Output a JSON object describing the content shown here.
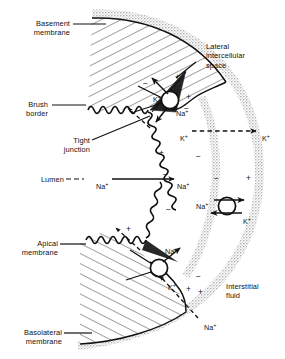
{
  "figure": {
    "background_color": "#ffffff",
    "ink_color": "#111111",
    "shade_color": "#c9c9c9"
  },
  "labels": {
    "basement_membrane": "Basement\nmembrane",
    "brush_border": "Brush\nborder",
    "tight_junction": "Tight\njunction",
    "lumen": "Lumen",
    "apical_membrane": "Apical\nmembrane",
    "basolateral_membrane": "Basolateral\nmembrane",
    "lateral_intercellular_space": "Lateral\nintercellular\nspace",
    "interstitial_fluid": "Interstitial\nfluid"
  },
  "ions": {
    "sodium": "Na",
    "potassium": "K",
    "charge_superscript": "+"
  },
  "ion_labels": [
    {
      "id": "na-upper-pump",
      "text": "Na+",
      "x": 176,
      "y": 109
    },
    {
      "id": "k-upper-pump",
      "text": "K+",
      "x": 153,
      "y": 95
    },
    {
      "id": "k-left-dashed",
      "text": "K+",
      "x": 180,
      "y": 134
    },
    {
      "id": "k-right-dashed",
      "text": "K+",
      "x": 262,
      "y": 134
    },
    {
      "id": "na-lumen-left",
      "text": "Na+",
      "x": 96,
      "y": 182
    },
    {
      "id": "na-lumen-right",
      "text": "Na+",
      "x": 177,
      "y": 182
    },
    {
      "id": "na-right-pump",
      "text": "Na+",
      "x": 196,
      "y": 202
    },
    {
      "id": "k-right-pump",
      "text": "K+",
      "x": 243,
      "y": 217
    },
    {
      "id": "na-lower-pump",
      "text": "Na+",
      "x": 165,
      "y": 247
    },
    {
      "id": "k-lower-pump",
      "text": "K+",
      "x": 168,
      "y": 283
    },
    {
      "id": "na-interstitial",
      "text": "Na+",
      "x": 204,
      "y": 323
    }
  ],
  "charges": [
    {
      "sign": "-",
      "x": 143,
      "y": 79
    },
    {
      "sign": "+",
      "x": 175,
      "y": 73
    },
    {
      "sign": "+",
      "x": 186,
      "y": 93
    },
    {
      "sign": "-",
      "x": 184,
      "y": 104
    },
    {
      "sign": "+",
      "x": 159,
      "y": 149
    },
    {
      "sign": "-",
      "x": 196,
      "y": 152
    },
    {
      "sign": "-",
      "x": 163,
      "y": 170
    },
    {
      "sign": "-",
      "x": 214,
      "y": 174
    },
    {
      "sign": "+",
      "x": 246,
      "y": 174
    },
    {
      "sign": "+",
      "x": 126,
      "y": 225
    },
    {
      "sign": "-",
      "x": 166,
      "y": 205
    },
    {
      "sign": "-",
      "x": 196,
      "y": 272
    },
    {
      "sign": "+",
      "x": 186,
      "y": 285
    },
    {
      "sign": "+",
      "x": 198,
      "y": 288
    }
  ],
  "structures": {
    "cell_interior_fill": "hatched-diagonal",
    "membrane_band": "gray-shaded-band",
    "brush_border_style": "zigzag-microvilli",
    "pumps": [
      {
        "id": "pump-upper-lateral",
        "cx": 170,
        "cy": 100,
        "r": 9
      },
      {
        "id": "pump-right-lateral",
        "cx": 227,
        "cy": 206,
        "r": 9
      },
      {
        "id": "pump-lower-basal",
        "cx": 159,
        "cy": 268,
        "r": 9
      }
    ]
  },
  "leader_lines": {
    "basement_membrane": true,
    "brush_border": true,
    "tight_junction": true,
    "lumen": true,
    "apical_membrane": true,
    "basolateral_membrane": true,
    "lateral_intercellular_space": true
  }
}
